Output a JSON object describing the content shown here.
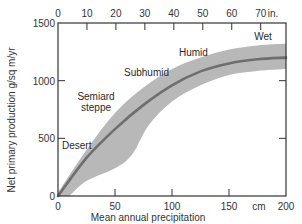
{
  "chart_data": {
    "type": "area",
    "title": "",
    "xlabel": "Mean annual precipitation",
    "x_unit_bottom": "cm",
    "x_unit_top": "in.",
    "ylabel": "Net primary production  g/sq m/yr",
    "xlim": [
      0,
      200
    ],
    "ylim": [
      0,
      1500
    ],
    "grid": false,
    "legend": null,
    "x_ticks_bottom": [
      0,
      50,
      100,
      150,
      200
    ],
    "x_tick_labels_bottom": [
      "0",
      "50",
      "100",
      "150",
      "200"
    ],
    "x_ticks_top_in": [
      0,
      10,
      20,
      30,
      40,
      50,
      60,
      70
    ],
    "x_tick_labels_top": [
      "0",
      "10",
      "20",
      "30",
      "40",
      "50",
      "60",
      "70"
    ],
    "y_ticks": [
      0,
      500,
      1000,
      1500
    ],
    "y_tick_labels": [
      "0",
      "500",
      "1000",
      "1500"
    ],
    "series": [
      {
        "name": "Mean net primary production",
        "x": [
          0,
          25,
          50,
          75,
          100,
          125,
          150,
          175,
          200
        ],
        "values": [
          0,
          330,
          580,
          790,
          960,
          1080,
          1150,
          1185,
          1200
        ],
        "color": "#6e6e6e"
      },
      {
        "name": "Range upper bound",
        "x": [
          0,
          25,
          50,
          75,
          100,
          125,
          150,
          175,
          200
        ],
        "values": [
          30,
          400,
          720,
          940,
          1100,
          1200,
          1270,
          1305,
          1320
        ],
        "color": "#b8b8b8"
      },
      {
        "name": "Range lower bound",
        "x": [
          10,
          25,
          50,
          65,
          80,
          100,
          125,
          150,
          175,
          200
        ],
        "values": [
          0,
          130,
          240,
          360,
          620,
          820,
          960,
          1050,
          1085,
          1100
        ],
        "color": "#b8b8b8"
      }
    ],
    "annotations": [
      {
        "text": "Desert",
        "x": 8,
        "y": 540
      },
      {
        "text": "Semiard",
        "x": 27,
        "y": 830
      },
      {
        "text": "steppe",
        "x": 29,
        "y": 730
      },
      {
        "text": "Subhumid",
        "x": 56,
        "y": 1010
      },
      {
        "text": "Humid",
        "x": 109,
        "y": 1190
      },
      {
        "text": "Wet",
        "x": 181,
        "y": 1365
      }
    ]
  },
  "labels": {
    "y_axis_title": "Net primary production  g/sq m/yr",
    "x_axis_title": "Mean annual precipitation",
    "unit_bottom": "cm",
    "unit_top": "in.",
    "zone_desert": "Desert",
    "zone_semiarid_1": "Semiard",
    "zone_semiarid_2": "steppe",
    "zone_subhumid": "Subhumid",
    "zone_humid": "Humid",
    "zone_wet": "Wet"
  },
  "colors": {
    "band": "#b8b8b8",
    "line": "#6e6e6e",
    "axis": "#333333"
  }
}
